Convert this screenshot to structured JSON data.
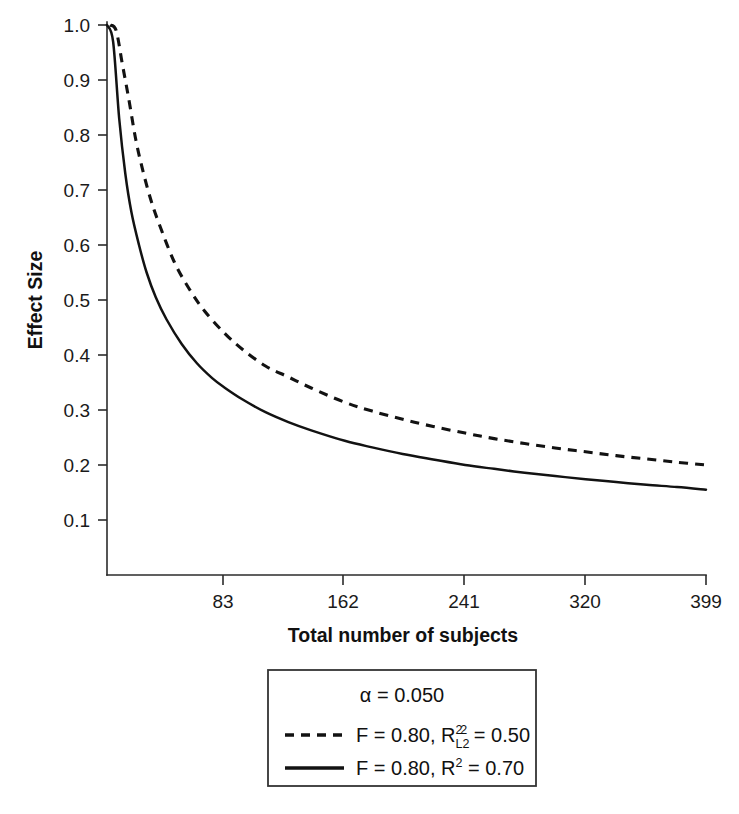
{
  "chart_data": {
    "type": "line",
    "title": "",
    "xlabel": "Total number of subjects",
    "ylabel": "Effect Size",
    "xlim": [
      6,
      399
    ],
    "ylim": [
      0.07,
      1.0
    ],
    "grid": false,
    "xticks": [
      83,
      162,
      241,
      320,
      399
    ],
    "xtick_labels": [
      "83",
      "162",
      "241",
      "320",
      "399"
    ],
    "yticks": [
      0.1,
      0.2,
      0.3,
      0.4,
      0.5,
      0.6,
      0.7,
      0.8,
      0.9,
      1.0
    ],
    "ytick_labels": [
      "0.1",
      "0.2",
      "0.3",
      "0.4",
      "0.5",
      "0.6",
      "0.7",
      "0.8",
      "0.9",
      "1.0"
    ],
    "legend_position": "below-axes",
    "series": [
      {
        "name": "F = 0.80, R2L2 = 0.50",
        "style": "dashed",
        "color": "#121212",
        "x": [
          8,
          12,
          16,
          20,
          25,
          30,
          35,
          40,
          50,
          60,
          70,
          83,
          95,
          110,
          125,
          140,
          162,
          180,
          200,
          220,
          241,
          260,
          280,
          300,
          320,
          340,
          360,
          380,
          399
        ],
        "y": [
          1.0,
          0.99,
          0.93,
          0.87,
          0.79,
          0.73,
          0.68,
          0.64,
          0.57,
          0.52,
          0.48,
          0.44,
          0.41,
          0.38,
          0.36,
          0.34,
          0.314,
          0.298,
          0.283,
          0.27,
          0.258,
          0.248,
          0.239,
          0.231,
          0.224,
          0.217,
          0.211,
          0.205,
          0.2
        ]
      },
      {
        "name": "F = 0.80, R2 = 0.70",
        "style": "solid",
        "color": "#121212",
        "x": [
          6,
          10,
          14,
          18,
          22,
          27,
          32,
          38,
          45,
          55,
          65,
          75,
          83,
          95,
          110,
          125,
          140,
          162,
          180,
          200,
          220,
          241,
          260,
          280,
          300,
          320,
          340,
          360,
          380,
          399
        ],
        "y": [
          1.0,
          0.97,
          0.83,
          0.73,
          0.66,
          0.6,
          0.55,
          0.505,
          0.465,
          0.42,
          0.385,
          0.358,
          0.341,
          0.319,
          0.296,
          0.278,
          0.263,
          0.244,
          0.232,
          0.22,
          0.21,
          0.2,
          0.193,
          0.186,
          0.18,
          0.174,
          0.169,
          0.164,
          0.16,
          0.155
        ]
      }
    ]
  },
  "axes": {
    "y_title": "Effect Size",
    "x_title": "Total number of subjects",
    "y_tick_labels": [
      "1.0",
      "0.9",
      "0.8",
      "0.7",
      "0.6",
      "0.5",
      "0.4",
      "0.3",
      "0.2",
      "0.1"
    ],
    "x_tick_labels": [
      "83",
      "162",
      "241",
      "320",
      "399"
    ]
  },
  "legend": {
    "alpha_label": "α = 0.050",
    "entries": [
      {
        "style": "dashed",
        "prefix": "F = 0.80, R",
        "sup": "2",
        "sub": "L2",
        "sup2": "2",
        "suffix": " = 0.50",
        "full_text": "F = 0.80, R2L2 = 0.50"
      },
      {
        "style": "solid",
        "prefix": "F = 0.80, R",
        "sup": "2",
        "sub": "",
        "sup2": "",
        "suffix": " = 0.70",
        "full_text": "F = 0.80, R2 = 0.70"
      }
    ]
  },
  "colors": {
    "line": "#121212",
    "axis": "#2b2b2b",
    "background": "#ffffff",
    "text": "#111111"
  }
}
